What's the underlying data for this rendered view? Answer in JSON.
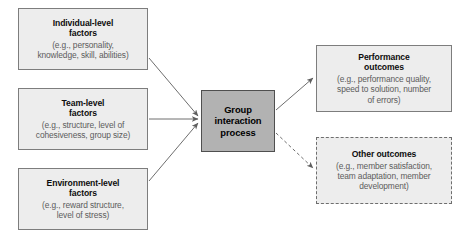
{
  "diagram": {
    "type": "flow-diagram",
    "title_visible": false,
    "colors": {
      "node_fill": "#ededed",
      "node_border": "#7d7d7d",
      "center_fill": "#b2b2b2",
      "center_border": "#4f4f4f",
      "heading_text": "#0d0d0d",
      "detail_text": "#5c5c5c",
      "arrow": "#6e6e6e",
      "background": "#ffffff"
    },
    "inputs": [
      {
        "id": "individual",
        "title": "Individual-level\nfactors",
        "title_line1": "Individual-level",
        "title_line2": "factors",
        "detail": "(e.g., personality,\nknowledge, skill, abilities)",
        "detail_line1": "(e.g., personality,",
        "detail_line2": "knowledge, skill, abilities)"
      },
      {
        "id": "team",
        "title_line1": "Team-level",
        "title_line2": "factors",
        "detail_line1": "(e.g., structure, level of",
        "detail_line2": "cohesiveness, group size)"
      },
      {
        "id": "environment",
        "title_line1": "Environment-level",
        "title_line2": "factors",
        "detail_line1": "(e.g., reward structure,",
        "detail_line2": "level of stress)"
      }
    ],
    "process": {
      "id": "group-interaction-process",
      "title_line1": "Group",
      "title_line2": "interaction",
      "title_line3": "process"
    },
    "outputs": [
      {
        "id": "performance",
        "border_style": "solid",
        "title_line1": "Performance",
        "title_line2": "outcomes",
        "detail_line1": "(e.g., performance quality,",
        "detail_line2": "speed to solution, number",
        "detail_line3": "of errors)"
      },
      {
        "id": "other",
        "border_style": "dashed",
        "title_line1": "Other outcomes",
        "title_line2": "",
        "detail_line1": "(e.g., member satisfaction,",
        "detail_line2": "team adaptation, member",
        "detail_line3": "development)"
      }
    ],
    "edges": [
      {
        "id": "individual-to-process",
        "from": "individual",
        "to": "group-interaction-process",
        "style": "solid"
      },
      {
        "id": "team-to-process",
        "from": "team",
        "to": "group-interaction-process",
        "style": "solid"
      },
      {
        "id": "environment-to-process",
        "from": "environment",
        "to": "group-interaction-process",
        "style": "solid"
      },
      {
        "id": "process-to-performance",
        "from": "group-interaction-process",
        "to": "performance",
        "style": "solid"
      },
      {
        "id": "process-to-other",
        "from": "group-interaction-process",
        "to": "other",
        "style": "dashed"
      }
    ]
  }
}
